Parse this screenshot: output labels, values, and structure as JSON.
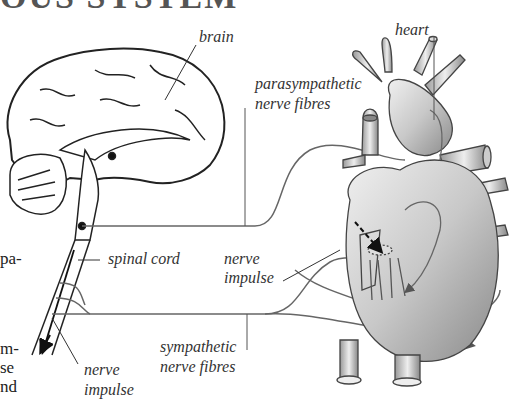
{
  "title_fragment": "OUS SYSTEM",
  "margin_text": [
    "pa-",
    "m-",
    "se",
    "nd"
  ],
  "labels": {
    "brain": "brain",
    "heart": "heart",
    "parasympathetic_line1": "parasympathetic",
    "parasympathetic_line2": "nerve fibres",
    "spinal_cord": "spinal cord",
    "nerve_impulse_heart_line1": "nerve",
    "nerve_impulse_heart_line2": "impulse",
    "sympathetic_line1": "sympathetic",
    "sympathetic_line2": "nerve fibres",
    "nerve_impulse_cord_line1": "nerve",
    "nerve_impulse_cord_line2": "impulse"
  },
  "colors": {
    "line": "#333333",
    "nerve": "#6a6a6a",
    "heart_fill": "#c8c8c8"
  }
}
